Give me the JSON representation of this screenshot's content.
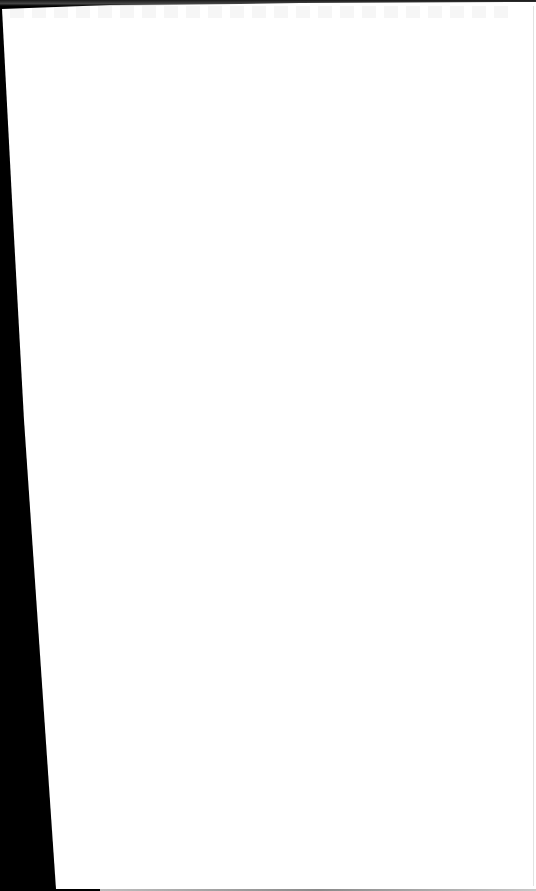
{
  "document": {
    "type": "scanned-page",
    "content_text": "",
    "page_background_color": "#ffffff",
    "scan_background_color": "#000000"
  }
}
